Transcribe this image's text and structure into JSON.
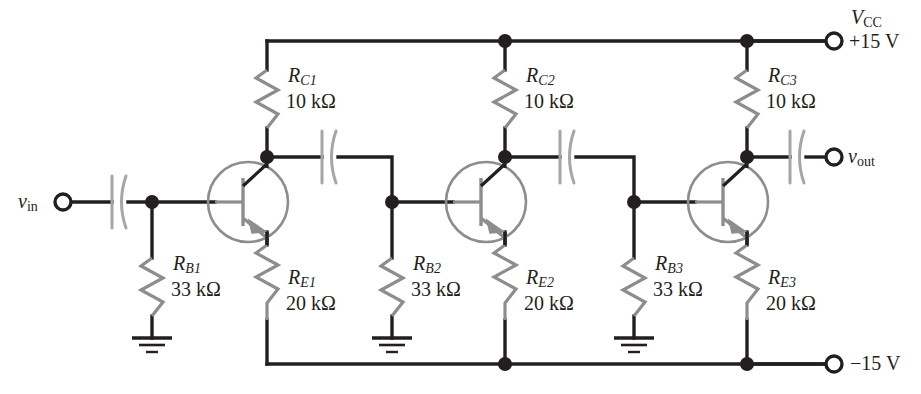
{
  "figure": {
    "type": "schematic",
    "supply_positive": "+15 V",
    "supply_negative": "−15 V"
  },
  "colors": {
    "wire": "#231f20",
    "device": "#8d8d8d",
    "background": "#ffffff"
  },
  "terminals": {
    "vin": {
      "name": "v",
      "sub": "in"
    },
    "vout": {
      "name": "v",
      "sub": "out"
    },
    "vcc": {
      "name": "V",
      "sub": "CC",
      "value": "+15 V"
    },
    "vee": {
      "value": "−15 V"
    }
  },
  "components": {
    "collector_resistors": [
      {
        "name": "R",
        "sub": "C1",
        "value": "10 kΩ"
      },
      {
        "name": "R",
        "sub": "C2",
        "value": "10 kΩ"
      },
      {
        "name": "R",
        "sub": "C3",
        "value": "10 kΩ"
      }
    ],
    "base_resistors": [
      {
        "name": "R",
        "sub": "B1",
        "value": "33 kΩ"
      },
      {
        "name": "R",
        "sub": "B2",
        "value": "33 kΩ"
      },
      {
        "name": "R",
        "sub": "B3",
        "value": "33 kΩ"
      }
    ],
    "emitter_resistors": [
      {
        "name": "R",
        "sub": "E1",
        "value": "20 kΩ"
      },
      {
        "name": "R",
        "sub": "E2",
        "value": "20 kΩ"
      },
      {
        "name": "R",
        "sub": "E3",
        "value": "20 kΩ"
      }
    ],
    "transistors": [
      {
        "label": "",
        "type": "npn"
      },
      {
        "label": "",
        "type": "npn"
      },
      {
        "label": "",
        "type": "npn"
      }
    ],
    "capacitors": [
      {
        "label": "",
        "role": "input-coupling"
      },
      {
        "label": "",
        "role": "interstage-coupling-1"
      },
      {
        "label": "",
        "role": "interstage-coupling-2"
      },
      {
        "label": "",
        "role": "output-coupling"
      }
    ],
    "grounds": [
      {
        "label": ""
      },
      {
        "label": ""
      },
      {
        "label": ""
      }
    ]
  }
}
